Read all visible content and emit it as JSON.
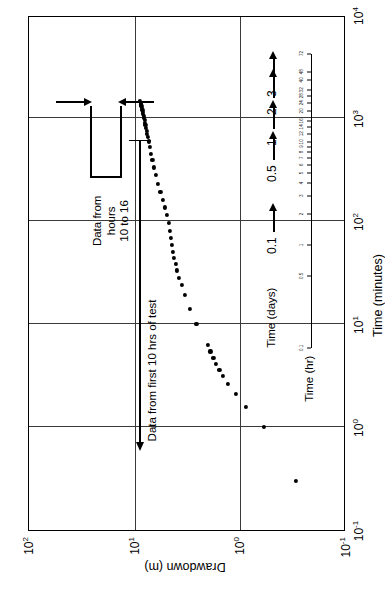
{
  "chart_data": {
    "type": "scatter",
    "title": "",
    "xlabel": "Time (minutes)",
    "ylabel": "Drawdown (m)",
    "xscale": "log",
    "yscale": "log",
    "xlim": [
      0.1,
      10000
    ],
    "ylim": [
      0.1,
      100
    ],
    "grid": true,
    "legend": null,
    "x_tick_labels": [
      "10-1",
      "100",
      "101",
      "102",
      "103",
      "104"
    ],
    "x_tick_values": [
      0.1,
      1,
      10,
      100,
      1000,
      10000
    ],
    "y_tick_labels": [
      "10-1",
      "100",
      "101",
      "102"
    ],
    "y_tick_values": [
      0.1,
      1,
      10,
      100
    ],
    "secondary_axes": [
      {
        "name": "Time (hr)",
        "label": "Time (hr)",
        "unit": "hours",
        "tick_values": [
          0.1,
          0.5,
          1,
          2,
          3,
          4,
          5,
          6,
          7,
          8,
          9,
          10,
          12,
          14,
          16,
          20,
          24,
          28,
          32,
          40,
          48,
          72
        ],
        "tick_labels": [
          "0.1",
          "0.5",
          "1",
          "2",
          "3",
          "4",
          "5",
          "6",
          "7",
          "8",
          "9",
          "10",
          "12",
          "14",
          "16",
          "20",
          "24",
          "28",
          "32",
          "40",
          "48",
          "72"
        ]
      },
      {
        "name": "Time (days)",
        "label": "Time (days)",
        "unit": "days",
        "tick_values": [
          0.1,
          0.5,
          1,
          2,
          3
        ],
        "tick_labels": [
          "0.1",
          "0.5",
          "1",
          "2",
          "3"
        ]
      }
    ],
    "annotations": [
      {
        "name": "data-from-hours-10-to-16",
        "text": "Data from\nhours\n10 to 16"
      },
      {
        "name": "data-from-first-10-hrs",
        "text": "Data from first 10 hrs of test"
      }
    ],
    "series": [
      {
        "name": "Drawdown observations",
        "marker": "circle",
        "color": "#000000",
        "points": [
          [
            0.3,
            0.3
          ],
          [
            1.0,
            0.6
          ],
          [
            1.55,
            0.88
          ],
          [
            2.1,
            1.1
          ],
          [
            2.6,
            1.3
          ],
          [
            3.1,
            1.45
          ],
          [
            3.6,
            1.58
          ],
          [
            4.1,
            1.7
          ],
          [
            4.7,
            1.8
          ],
          [
            5.4,
            1.92
          ],
          [
            6.2,
            2.02
          ],
          [
            10.0,
            2.6
          ],
          [
            14.0,
            3.0
          ],
          [
            19.0,
            3.35
          ],
          [
            24.0,
            3.6
          ],
          [
            28.0,
            3.8
          ],
          [
            33.0,
            3.95
          ],
          [
            38.0,
            4.1
          ],
          [
            44.0,
            4.22
          ],
          [
            50.0,
            4.32
          ],
          [
            58.0,
            4.42
          ],
          [
            68.0,
            4.52
          ],
          [
            80.0,
            4.62
          ],
          [
            95.0,
            4.75
          ],
          [
            115.0,
            4.95
          ],
          [
            135.0,
            5.15
          ],
          [
            160.0,
            5.4
          ],
          [
            190.0,
            5.7
          ],
          [
            230.0,
            6.0
          ],
          [
            280.0,
            6.3
          ],
          [
            330.0,
            6.55
          ],
          [
            390.0,
            6.8
          ],
          [
            450.0,
            7.0
          ],
          [
            520.0,
            7.2
          ],
          [
            590.0,
            7.38
          ],
          [
            650.0,
            7.52
          ],
          [
            700.0,
            7.62
          ],
          [
            750.0,
            7.72
          ],
          [
            800.0,
            7.82
          ],
          [
            850.0,
            7.9
          ],
          [
            900.0,
            7.98
          ],
          [
            950.0,
            8.06
          ],
          [
            1000.0,
            8.14
          ],
          [
            1050.0,
            8.22
          ],
          [
            1100.0,
            8.3
          ],
          [
            1150.0,
            8.38
          ],
          [
            1200.0,
            8.46
          ],
          [
            1250.0,
            8.54
          ],
          [
            1300.0,
            8.62
          ],
          [
            1350.0,
            8.7
          ],
          [
            1400.0,
            8.78
          ],
          [
            1450.0,
            8.86
          ]
        ]
      }
    ]
  },
  "axes": {
    "x_title": "Time (minutes)",
    "y_title": "Drawdown (m)",
    "hours_title": "Time (hr)",
    "days_title": "Time (days)"
  },
  "x_ticks": [
    {
      "label_mantissa": "10",
      "label_exponent": "-1"
    },
    {
      "label_mantissa": "10",
      "label_exponent": "0"
    },
    {
      "label_mantissa": "10",
      "label_exponent": "1"
    },
    {
      "label_mantissa": "10",
      "label_exponent": "2"
    },
    {
      "label_mantissa": "10",
      "label_exponent": "3"
    },
    {
      "label_mantissa": "10",
      "label_exponent": "4"
    }
  ],
  "y_ticks": [
    {
      "label_mantissa": "10",
      "label_exponent": "-1"
    },
    {
      "label_mantissa": "10",
      "label_exponent": "0"
    },
    {
      "label_mantissa": "10",
      "label_exponent": "1"
    },
    {
      "label_mantissa": "10",
      "label_exponent": "2"
    }
  ],
  "day_labels": [
    "0.1",
    "0.5",
    "1",
    "2",
    "3"
  ],
  "hour_labels": [
    "0.1",
    "0.5",
    "1",
    "2",
    "3",
    "4",
    "5",
    "6",
    "7",
    "8",
    "9",
    "10",
    "12",
    "14",
    "16",
    "20",
    "24",
    "28",
    "32",
    "40",
    "48",
    "72"
  ],
  "annotations": {
    "hours_block_line1": "Data from",
    "hours_block_line2": "hours",
    "hours_block_line3": "10 to 16",
    "first_ten_hrs": "Data from first 10 hrs of test"
  }
}
